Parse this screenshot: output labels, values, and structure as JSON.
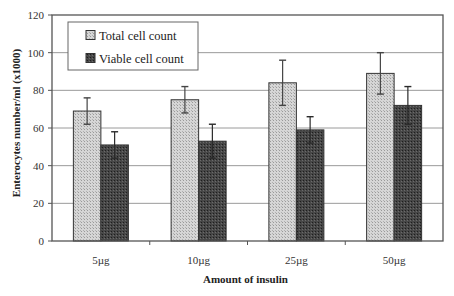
{
  "chart_data": {
    "type": "bar",
    "title": "",
    "xlabel": "Amount of insulin",
    "ylabel": "Enterocytes number/ml (x1000)",
    "categories": [
      "5µg",
      "10µg",
      "25µg",
      "50µg"
    ],
    "series": [
      {
        "name": "Total cell count",
        "values": [
          69,
          75,
          84,
          89
        ],
        "error_low": [
          62,
          68,
          72,
          78
        ],
        "error_high": [
          76,
          82,
          96,
          100
        ],
        "color": "#cfcfcf"
      },
      {
        "name": "Viable cell count",
        "values": [
          51,
          53,
          59,
          72
        ],
        "error_low": [
          44,
          44,
          52,
          62
        ],
        "error_high": [
          58,
          62,
          66,
          82
        ],
        "color": "#3f3f3f"
      }
    ],
    "ylim": [
      0,
      120
    ],
    "yticks": [
      0,
      20,
      40,
      60,
      80,
      100,
      120
    ],
    "grid": true,
    "legend_position": "upper-left-inside"
  },
  "labels": {
    "xlabel": "Amount of insulin",
    "ylabel": "Enterocytes number/ml (x1000)"
  }
}
